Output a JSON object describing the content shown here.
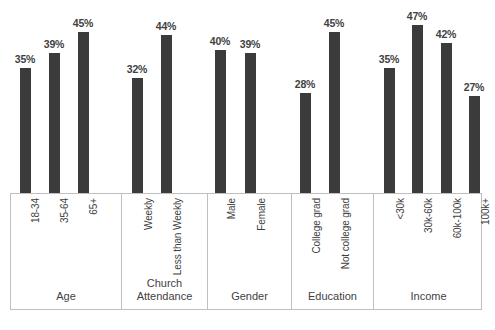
{
  "chart_data": {
    "type": "bar",
    "title": "",
    "subtitle": "",
    "xlabel": "",
    "ylabel": "",
    "ylim": [
      0,
      50
    ],
    "grid": false,
    "legend_position": "none",
    "value_suffix": "%",
    "bar_color": "#3b3b3b",
    "groups": [
      {
        "name": "Age",
        "title_lines": [
          "Age"
        ],
        "categories": [
          "18-34",
          "35-64",
          "65+"
        ],
        "values": [
          35,
          39,
          45
        ],
        "labels": [
          "35%",
          "39%",
          "45%"
        ]
      },
      {
        "name": "Church Attendance",
        "title_lines": [
          "Church",
          "Attendance"
        ],
        "categories": [
          "Weekly",
          "Less than Weekly"
        ],
        "values": [
          32,
          44
        ],
        "labels": [
          "32%",
          "44%"
        ]
      },
      {
        "name": "Gender",
        "title_lines": [
          "Gender"
        ],
        "categories": [
          "Male",
          "Female"
        ],
        "values": [
          40,
          39
        ],
        "labels": [
          "40%",
          "39%"
        ]
      },
      {
        "name": "Education",
        "title_lines": [
          "Education"
        ],
        "categories": [
          "College grad",
          "Not college grad"
        ],
        "values": [
          28,
          45
        ],
        "labels": [
          "28%",
          "45%"
        ]
      },
      {
        "name": "Income",
        "title_lines": [
          "Income"
        ],
        "categories": [
          "<30k",
          "30k-60k",
          "60k-100k",
          "100k+"
        ],
        "values": [
          35,
          47,
          42,
          27
        ],
        "labels": [
          "35%",
          "47%",
          "42%",
          "27%"
        ]
      }
    ],
    "categories": [
      "18-34",
      "35-64",
      "65+",
      "Weekly",
      "Less than Weekly",
      "Male",
      "Female",
      "College grad",
      "Not college grad",
      "<30k",
      "30k-60k",
      "60k-100k",
      "100k+"
    ],
    "values": [
      35,
      39,
      45,
      32,
      44,
      40,
      39,
      28,
      45,
      35,
      47,
      42,
      27
    ]
  }
}
